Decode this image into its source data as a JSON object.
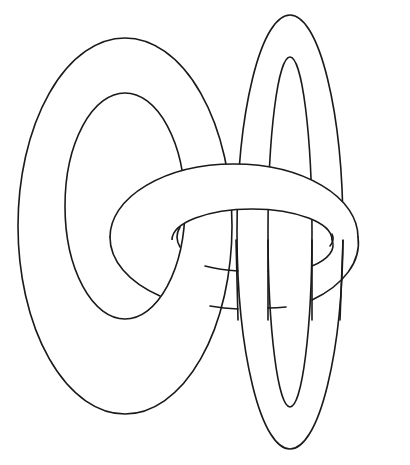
{
  "figure": {
    "title": "Three interlinked rings",
    "colors": {
      "background": "#ffffff",
      "line": "#1a1a1a",
      "fill": "#ffffff"
    },
    "rings": [
      {
        "name": "left-upright-ring",
        "orientation": "vertical"
      },
      {
        "name": "right-tall-ring",
        "orientation": "vertical"
      },
      {
        "name": "center-horizontal-ring",
        "orientation": "horizontal"
      }
    ]
  }
}
